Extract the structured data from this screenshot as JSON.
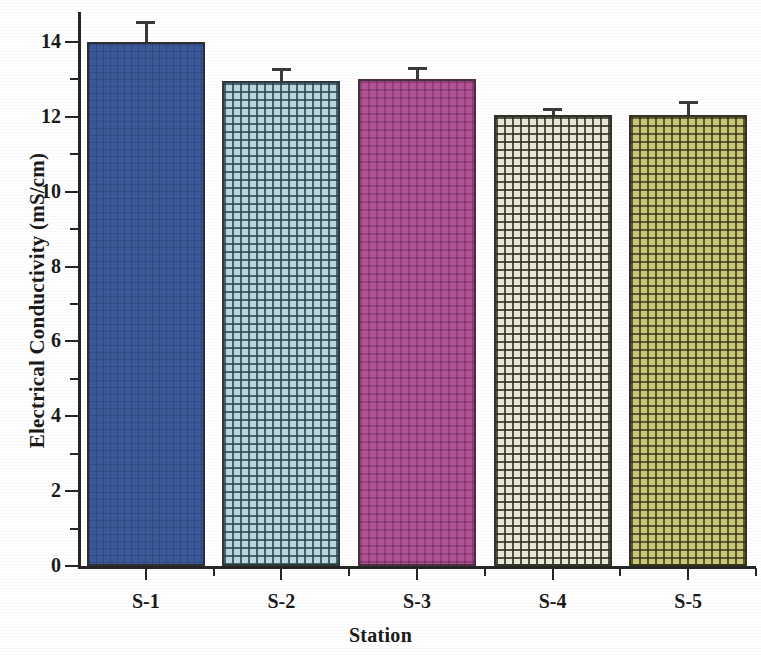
{
  "chart_data": {
    "type": "bar",
    "title": "",
    "xlabel": "Station",
    "ylabel": "Electrical Conductivity (mS/cm)",
    "categories": [
      "S-1",
      "S-2",
      "S-3",
      "S-4",
      "S-5"
    ],
    "values": [
      14.0,
      12.95,
      13.0,
      12.05,
      12.05
    ],
    "errors": [
      0.55,
      0.35,
      0.32,
      0.18,
      0.38
    ],
    "ylim": [
      0,
      14.8
    ],
    "y_major_ticks": [
      0,
      2,
      4,
      6,
      8,
      10,
      12,
      14
    ],
    "y_minor_ticks": [
      1,
      3,
      5,
      7,
      9,
      11,
      13
    ],
    "y_tick_labels": [
      "0",
      "2",
      "4",
      "6",
      "8",
      "10",
      "12",
      "14"
    ],
    "grid": false,
    "legend": null,
    "legend_position": "none",
    "series": [
      {
        "name": "Electrical Conductivity",
        "values": [
          14.0,
          12.95,
          13.0,
          12.05,
          12.05
        ]
      }
    ],
    "bar_colors": [
      "#3b5998",
      "#bcd7de",
      "#b35397",
      "#e9e9d6",
      "#cbc977"
    ],
    "bar_patterns": [
      "solid-fine-grid",
      "cross-hatch",
      "cross-hatch",
      "cross-hatch",
      "cross-hatch"
    ],
    "axis_color": "#262626",
    "error_bar_color": "#3a3a3a"
  }
}
